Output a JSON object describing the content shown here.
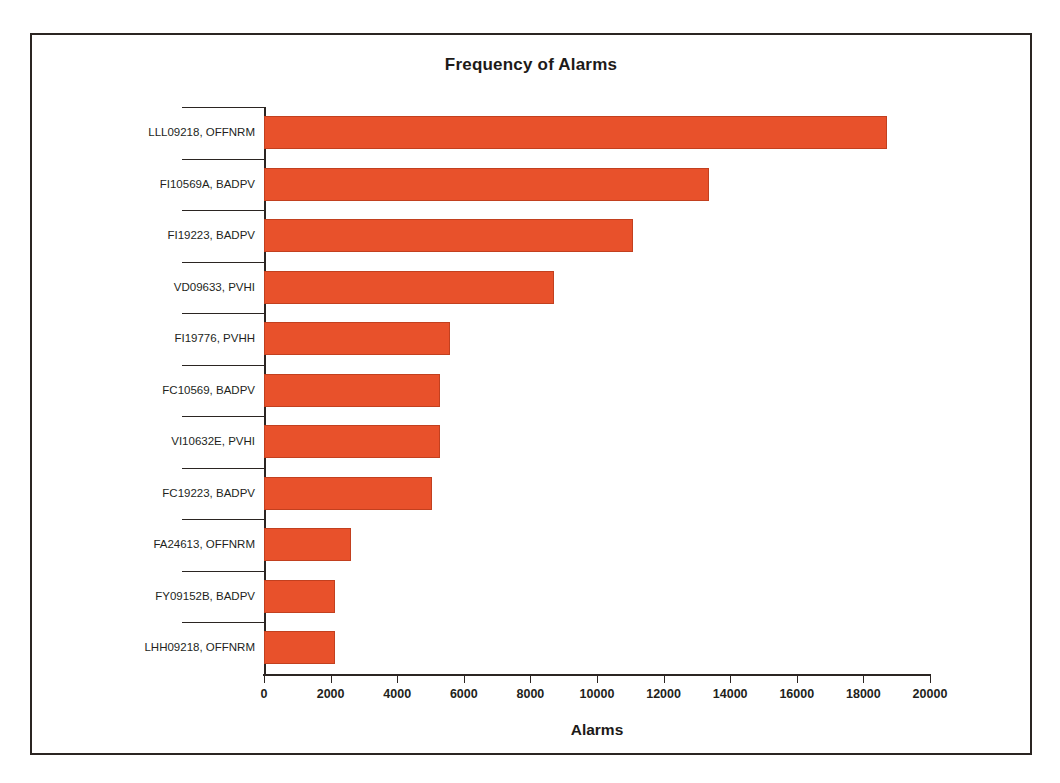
{
  "figure": {
    "frame_color": "#2b2522",
    "background": "#ffffff"
  },
  "chart_data": {
    "type": "bar",
    "orientation": "horizontal",
    "title": "Frequency of Alarms",
    "xlabel": "Alarms",
    "ylabel": "",
    "xlim": [
      0,
      20000
    ],
    "xticks": [
      0,
      2000,
      4000,
      6000,
      8000,
      10000,
      12000,
      14000,
      16000,
      18000,
      20000
    ],
    "xtick_labels": [
      "0",
      "2000",
      "4000",
      "6000",
      "8000",
      "10000",
      "12000",
      "14000",
      "16000",
      "18000",
      "20000"
    ],
    "grid": false,
    "legend": null,
    "bar_color": "#e8512b",
    "bar_edge_color": "#c2401f",
    "categories": [
      "LLL09218, OFFNRM",
      "FI10569A, BADPV",
      "FI19223, BADPV",
      "VD09633, PVHI",
      "FI19776, PVHH",
      "FC10569, BADPV",
      "VI10632E, PVHI",
      "FC19223, BADPV",
      "FA24613, OFFNRM",
      "FY09152B, BADPV",
      "LHH09218, OFFNRM"
    ],
    "values": [
      18700,
      13370,
      11080,
      8700,
      5580,
      5290,
      5290,
      5050,
      2610,
      2130,
      2130
    ],
    "series": [
      {
        "name": "Alarms",
        "values": [
          18700,
          13370,
          11080,
          8700,
          5580,
          5290,
          5290,
          5050,
          2610,
          2130,
          2130
        ]
      }
    ]
  }
}
